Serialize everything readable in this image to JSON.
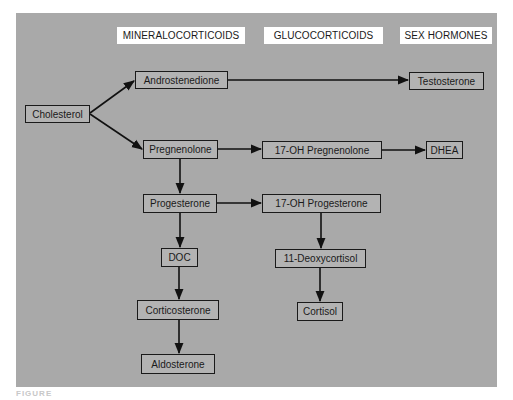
{
  "diagram": {
    "type": "flowchart",
    "colors": {
      "panel_background": "#a9a9a9",
      "node_fill": "#b3b3b3",
      "node_border": "#1a1a1a",
      "header_fill": "#ffffff",
      "arrow": "#111111"
    },
    "column_headers": [
      {
        "id": "mineralocorticoids",
        "label": "MINERALOCORTICOIDS"
      },
      {
        "id": "glucocorticoids",
        "label": "GLUCOCORTICOIDS"
      },
      {
        "id": "sex_hormones",
        "label": "SEX HORMONES"
      }
    ],
    "nodes": [
      {
        "id": "cholesterol",
        "label": "Cholesterol"
      },
      {
        "id": "androstenedione",
        "label": "Androstenedione"
      },
      {
        "id": "testosterone",
        "label": "Testosterone"
      },
      {
        "id": "pregnenolone",
        "label": "Pregnenolone"
      },
      {
        "id": "oh17_pregnenolone",
        "label": "17-OH Pregnenolone"
      },
      {
        "id": "dhea",
        "label": "DHEA"
      },
      {
        "id": "progesterone",
        "label": "Progesterone"
      },
      {
        "id": "oh17_progesterone",
        "label": "17-OH Progesterone"
      },
      {
        "id": "doc",
        "label": "DOC"
      },
      {
        "id": "deoxycortisol11",
        "label": "11-Deoxycortisol"
      },
      {
        "id": "corticosterone",
        "label": "Corticosterone"
      },
      {
        "id": "cortisol",
        "label": "Cortisol"
      },
      {
        "id": "aldosterone",
        "label": "Aldosterone"
      }
    ],
    "edges": [
      {
        "from": "cholesterol",
        "to": "androstenedione"
      },
      {
        "from": "cholesterol",
        "to": "pregnenolone"
      },
      {
        "from": "androstenedione",
        "to": "testosterone"
      },
      {
        "from": "pregnenolone",
        "to": "oh17_pregnenolone"
      },
      {
        "from": "oh17_pregnenolone",
        "to": "dhea"
      },
      {
        "from": "pregnenolone",
        "to": "progesterone"
      },
      {
        "from": "progesterone",
        "to": "oh17_progesterone"
      },
      {
        "from": "progesterone",
        "to": "doc"
      },
      {
        "from": "oh17_progesterone",
        "to": "deoxycortisol11"
      },
      {
        "from": "doc",
        "to": "corticosterone"
      },
      {
        "from": "deoxycortisol11",
        "to": "cortisol"
      },
      {
        "from": "corticosterone",
        "to": "aldosterone"
      }
    ]
  },
  "caption": "FIGURE"
}
